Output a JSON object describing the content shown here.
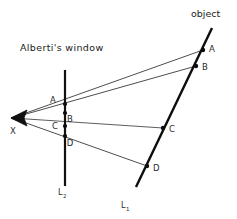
{
  "figure": {
    "title_caption": "Alberti's window",
    "object_caption": "object",
    "background_color": "#ffffff",
    "ink_color": "#111111",
    "ray_color": "#444444"
  },
  "labels": {
    "viewpoint": "X",
    "window_line_name": "L",
    "window_line_subscript": "2",
    "object_line_name": "L",
    "object_line_subscript": "1"
  },
  "window_points": [
    {
      "label": "A",
      "x": 65,
      "y": 104,
      "label_x": 53,
      "label_y": 101
    },
    {
      "label": "B",
      "x": 65,
      "y": 113,
      "label_x": 67,
      "label_y": 120
    },
    {
      "label": "C",
      "x": 65,
      "y": 126,
      "label_x": 53,
      "label_y": 130
    },
    {
      "label": "D",
      "x": 65,
      "y": 136,
      "label_x": 67,
      "label_y": 146
    }
  ],
  "object_points": [
    {
      "label": "A",
      "x": 203,
      "y": 50,
      "label_x": 207,
      "label_y": 50
    },
    {
      "label": "B",
      "x": 196,
      "y": 66,
      "label_x": 201,
      "label_y": 68
    },
    {
      "label": "C",
      "x": 163,
      "y": 128,
      "label_x": 168,
      "label_y": 131
    },
    {
      "label": "D",
      "x": 147,
      "y": 166,
      "label_x": 152,
      "label_y": 170
    }
  ],
  "viewpoint": {
    "x": 12,
    "y": 118
  },
  "window_line": {
    "x": 65,
    "y_top": 70,
    "y_bottom": 186,
    "width": 2.2
  },
  "object_line": {
    "x1": 212,
    "y1": 28,
    "x2": 136,
    "y2": 187,
    "width": 2.4
  },
  "rays": [
    {
      "name": "ray-to-A",
      "to_x": 203,
      "to_y": 50
    },
    {
      "name": "ray-to-B",
      "to_x": 196,
      "to_y": 66
    },
    {
      "name": "ray-to-C",
      "to_x": 163,
      "to_y": 128
    },
    {
      "name": "ray-to-D",
      "to_x": 147,
      "to_y": 166
    }
  ],
  "caption_positions": {
    "window_caption_x": 20,
    "window_caption_y": 50,
    "object_caption_x": 191,
    "object_caption_y": 16,
    "viewpoint_label_x": 10,
    "viewpoint_label_y": 133,
    "window_line_label_x": 58,
    "window_line_label_y": 194,
    "object_line_label_x": 121,
    "object_line_label_y": 207
  }
}
